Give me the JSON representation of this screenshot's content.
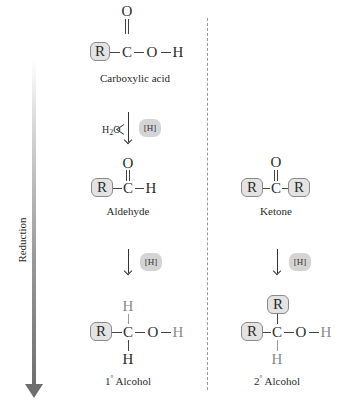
{
  "side_arrow": {
    "label": "Reduction"
  },
  "reagent": {
    "label": "[H]",
    "water": "H",
    "water_sub": "2",
    "water_o": "O"
  },
  "atoms": {
    "R": "R",
    "C": "C",
    "O": "O",
    "H": "H"
  },
  "left_column": {
    "carboxylic_acid": {
      "label": "Carboxylic acid"
    },
    "aldehyde": {
      "label": "Aldehyde"
    },
    "primary_alcohol": {
      "label_num": "1",
      "label_deg": "°",
      "label_text": " Alcohol"
    }
  },
  "right_column": {
    "ketone": {
      "label": "Ketone"
    },
    "secondary_alcohol": {
      "label_num": "2",
      "label_deg": "°",
      "label_text": " Alcohol"
    }
  },
  "colors": {
    "r_box_fill": "#e3e3e3",
    "added_hydrogen": "#8a8a8a",
    "reagent_pill": "#d4d4d4"
  }
}
